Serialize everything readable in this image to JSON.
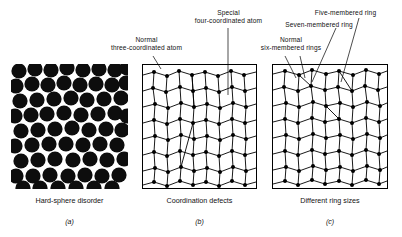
{
  "figure": {
    "panels": [
      {
        "id": "a",
        "caption": "Hard-sphere disorder",
        "subcaption": "(a)",
        "style": "filled-black-spheres",
        "annotations": []
      },
      {
        "id": "b",
        "caption": "Coordination defects",
        "subcaption": "(b)",
        "style": "ring-network",
        "annotations": [
          {
            "key": "normal_three",
            "line1": "Normal",
            "line2": "three-coordinated atom"
          },
          {
            "key": "special_four",
            "line1": "Special",
            "line2": "four-coordinated atom"
          }
        ]
      },
      {
        "id": "c",
        "caption": "Different ring sizes",
        "subcaption": "(c)",
        "style": "ring-network",
        "annotations": [
          {
            "key": "normal_six",
            "line1": "Normal",
            "line2": "six-membered rings"
          },
          {
            "key": "seven_ring",
            "line1": "Seven-membered ring",
            "line2": ""
          },
          {
            "key": "five_ring",
            "line1": "Five-membered ring",
            "line2": ""
          }
        ]
      }
    ],
    "colors": {
      "sphere_fill": "#0d0d0d",
      "background": "#ffffff",
      "line": "#000000",
      "text": "#111111"
    }
  }
}
